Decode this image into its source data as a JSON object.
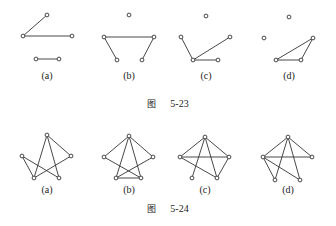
{
  "figures": [
    {
      "caption_prefix": "图",
      "caption_number": "5-23",
      "caption_y": 104,
      "label_y": 77,
      "graphs": [
        {
          "label": "(a)",
          "cx": 47,
          "nodes": {
            "T": [
              47,
              15
            ],
            "L": [
              23,
              36
            ],
            "R": [
              72,
              36
            ],
            "BL": [
              36,
              59
            ],
            "BR": [
              59,
              59
            ]
          },
          "edges": [
            [
              "T",
              "L"
            ],
            [
              "L",
              "R"
            ],
            [
              "BL",
              "BR"
            ]
          ]
        },
        {
          "label": "(b)",
          "cx": 129,
          "nodes": {
            "T": [
              129,
              15
            ],
            "L": [
              104,
              37
            ],
            "R": [
              154,
              37
            ],
            "BL": [
              117,
              60
            ],
            "BR": [
              142,
              60
            ]
          },
          "edges": [
            [
              "L",
              "R"
            ],
            [
              "L",
              "BL"
            ],
            [
              "R",
              "BR"
            ]
          ]
        },
        {
          "label": "(c)",
          "cx": 206,
          "nodes": {
            "T": [
              206,
              16
            ],
            "L": [
              181,
              37
            ],
            "R": [
              230,
              37
            ],
            "BL": [
              193,
              60
            ],
            "BR": [
              218,
              60
            ]
          },
          "edges": [
            [
              "L",
              "BL"
            ],
            [
              "BL",
              "R"
            ],
            [
              "BL",
              "BR"
            ]
          ]
        },
        {
          "label": "(d)",
          "cx": 289,
          "nodes": {
            "T": [
              289,
              17
            ],
            "L": [
              264,
              38
            ],
            "R": [
              313,
              38
            ],
            "BL": [
              276,
              60
            ],
            "BR": [
              301,
              60
            ]
          },
          "edges": [
            [
              "BL",
              "BR"
            ],
            [
              "BL",
              "R"
            ],
            [
              "BR",
              "R"
            ]
          ]
        }
      ]
    },
    {
      "caption_prefix": "图",
      "caption_number": "5-24",
      "caption_y": 209,
      "label_y": 191,
      "graphs": [
        {
          "label": "(a)",
          "cx": 47,
          "nodes": {
            "T": [
              47,
              135
            ],
            "L": [
              22,
              156
            ],
            "R": [
              71,
              156
            ],
            "BL": [
              34,
              178
            ],
            "BR": [
              59,
              178
            ]
          },
          "edges": [
            [
              "T",
              "BL"
            ],
            [
              "T",
              "BR"
            ],
            [
              "T",
              "R"
            ],
            [
              "L",
              "BL"
            ],
            [
              "L",
              "BR"
            ],
            [
              "R",
              "BL"
            ]
          ]
        },
        {
          "label": "(b)",
          "cx": 129,
          "nodes": {
            "T": [
              129,
              136
            ],
            "L": [
              104,
              157
            ],
            "R": [
              153,
              157
            ],
            "BL": [
              116,
              178
            ],
            "BR": [
              141,
              178
            ]
          },
          "edges": [
            [
              "T",
              "L"
            ],
            [
              "T",
              "R"
            ],
            [
              "T",
              "BL"
            ],
            [
              "T",
              "BR"
            ],
            [
              "L",
              "BR"
            ],
            [
              "R",
              "BL"
            ],
            [
              "BL",
              "BR"
            ]
          ]
        },
        {
          "label": "(c)",
          "cx": 205,
          "nodes": {
            "T": [
              205,
              137
            ],
            "L": [
              180,
              157
            ],
            "R": [
              229,
              157
            ],
            "BL": [
              192,
              178
            ],
            "BR": [
              217,
              178
            ]
          },
          "edges": [
            [
              "T",
              "L"
            ],
            [
              "T",
              "R"
            ],
            [
              "L",
              "R"
            ],
            [
              "T",
              "BL"
            ],
            [
              "T",
              "BR"
            ],
            [
              "L",
              "BR"
            ],
            [
              "R",
              "BR"
            ]
          ]
        },
        {
          "label": "(d)",
          "cx": 288,
          "nodes": {
            "T": [
              288,
              137
            ],
            "L": [
              263,
              157
            ],
            "R": [
              312,
              157
            ],
            "BL": [
              275,
              180
            ],
            "BR": [
              300,
              180
            ]
          },
          "edges": [
            [
              "T",
              "L"
            ],
            [
              "T",
              "R"
            ],
            [
              "L",
              "R"
            ],
            [
              "T",
              "BL"
            ],
            [
              "T",
              "BR"
            ],
            [
              "L",
              "BL"
            ],
            [
              "L",
              "BR"
            ]
          ]
        }
      ]
    }
  ]
}
